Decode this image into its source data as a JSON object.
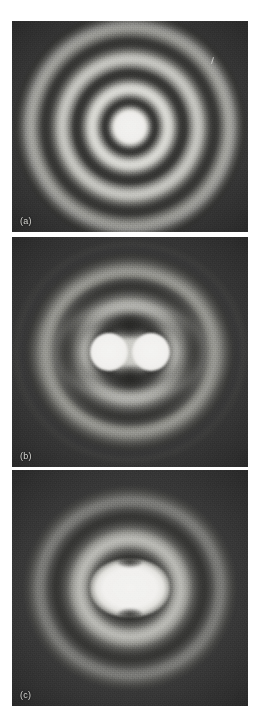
{
  "figure": {
    "background_color": "#ffffff",
    "panel_background_color": "#3b3b3b",
    "peak_color": "#f2f2f0",
    "label_color": "#d6d6d2",
    "panel_count": 3
  },
  "panels": [
    {
      "id": "panel-a",
      "label": "(a)",
      "caption": "Single point source: circular Airy diffraction pattern with concentric bright and dark rings",
      "pattern_type": "concentric-rings",
      "source_count": 1,
      "resolution_state": "single-source",
      "visible_ring_count": 5,
      "central_disk_shape": "circular",
      "has_scratch_artifact": true
    },
    {
      "id": "panel-b",
      "label": "(b)",
      "caption": "Two point sources well separated: two distinct bright disks, clearly resolved",
      "pattern_type": "two-resolved-disks",
      "source_count": 2,
      "resolution_state": "resolved",
      "visible_ring_count": 4,
      "central_disk_shape": "two-circles",
      "has_scratch_artifact": false
    },
    {
      "id": "panel-c",
      "label": "(c)",
      "caption": "Two point sources too close: patterns merge into a single elongated blob, unresolved",
      "pattern_type": "merged-elongated-blob",
      "source_count": 2,
      "resolution_state": "unresolved",
      "visible_ring_count": 4,
      "central_disk_shape": "horizontally-elongated-oval",
      "has_scratch_artifact": false
    }
  ]
}
